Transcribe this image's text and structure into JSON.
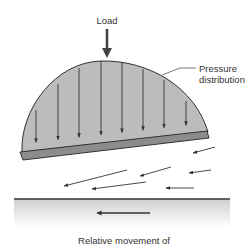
{
  "labels": {
    "load": "Load",
    "pressure_line1": "Pressure",
    "pressure_line2": "distribution",
    "relative_movement": "Relative movement of"
  },
  "components": [
    {
      "name": "load-arrow",
      "description": "Downward load arrow"
    },
    {
      "name": "pressure-distribution",
      "description": "Semi-elliptical pressure profile above the pad",
      "pressure_arrow_count": 8
    },
    {
      "name": "tilted-pad",
      "description": "Inclined bearing pad"
    },
    {
      "name": "lubricant-flow",
      "description": "Flow arrows in the converging oil wedge",
      "arrow_count": 8
    },
    {
      "name": "moving-surface",
      "description": "Lower surface moving to the left"
    }
  ],
  "colors": {
    "pressure_fill": "#bcbcbc",
    "pad_fill": "#8c8c8c",
    "stroke": "#333333",
    "surface_shade": "#d8d8d8"
  }
}
